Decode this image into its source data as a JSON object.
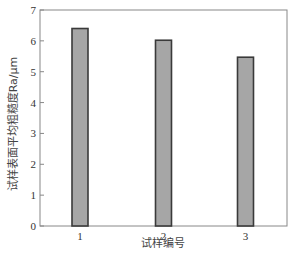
{
  "chart_data": {
    "type": "bar",
    "title": "",
    "xlabel": "试样编号",
    "ylabel": "试样表面平均粗糙度Ra/μm",
    "categories": [
      "1",
      "2",
      "3"
    ],
    "values": [
      6.4,
      6.02,
      5.47
    ],
    "ylim": [
      0,
      7
    ],
    "yticks": [
      0,
      1,
      2,
      3,
      4,
      5,
      6,
      7
    ],
    "grid": false,
    "legend": null,
    "colors": {
      "bar_fill": "#a6a6a6",
      "bar_edge": "#3a3a3a",
      "axis": "#888888"
    }
  }
}
